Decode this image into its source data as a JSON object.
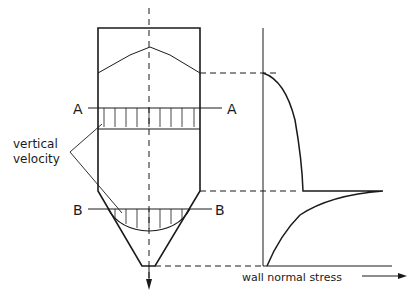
{
  "diagram": {
    "colors": {
      "line": "#1a1a1a",
      "background": "#ffffff"
    },
    "labels": {
      "section_a_left": "A",
      "section_a_right": "A",
      "section_b_left": "B",
      "section_b_right": "B",
      "velocity_line1": "vertical",
      "velocity_line2": "velocity",
      "stress_axis": "wall normal stress"
    },
    "sections": [
      {
        "name": "A",
        "location": "vertical section (cylinder)",
        "profile": "uniform"
      },
      {
        "name": "B",
        "location": "hopper",
        "profile": "parabolic"
      }
    ],
    "stress_curve": {
      "description": "wall normal stress increases from top of fill, saturates in vertical section, peaks at transition, decreases to zero at outlet"
    }
  }
}
